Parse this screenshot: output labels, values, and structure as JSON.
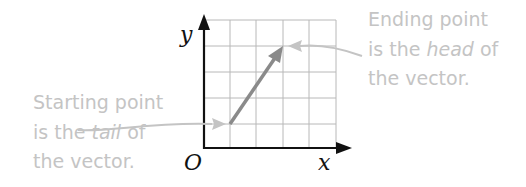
{
  "diagram": {
    "axes": {
      "x_label": "x",
      "y_label": "y",
      "origin_label": "O"
    },
    "grid": {
      "columns": 5,
      "rows": 5
    },
    "vector": {
      "tail": [
        1,
        1
      ],
      "head": [
        3,
        4
      ]
    },
    "captions": {
      "tail": {
        "line1": "Starting point",
        "line2_pre": "is the ",
        "line2_em": "tail",
        "line2_post": " of",
        "line3": "the vector."
      },
      "head": {
        "line1": "Ending point",
        "line2_pre": "is the ",
        "line2_em": "head",
        "line2_post": " of",
        "line3": "the vector."
      }
    },
    "colors": {
      "caption": "#c4c4c4",
      "vector": "#8a8a8a",
      "axes": "#111111",
      "grid": "#b0b0b0"
    }
  }
}
